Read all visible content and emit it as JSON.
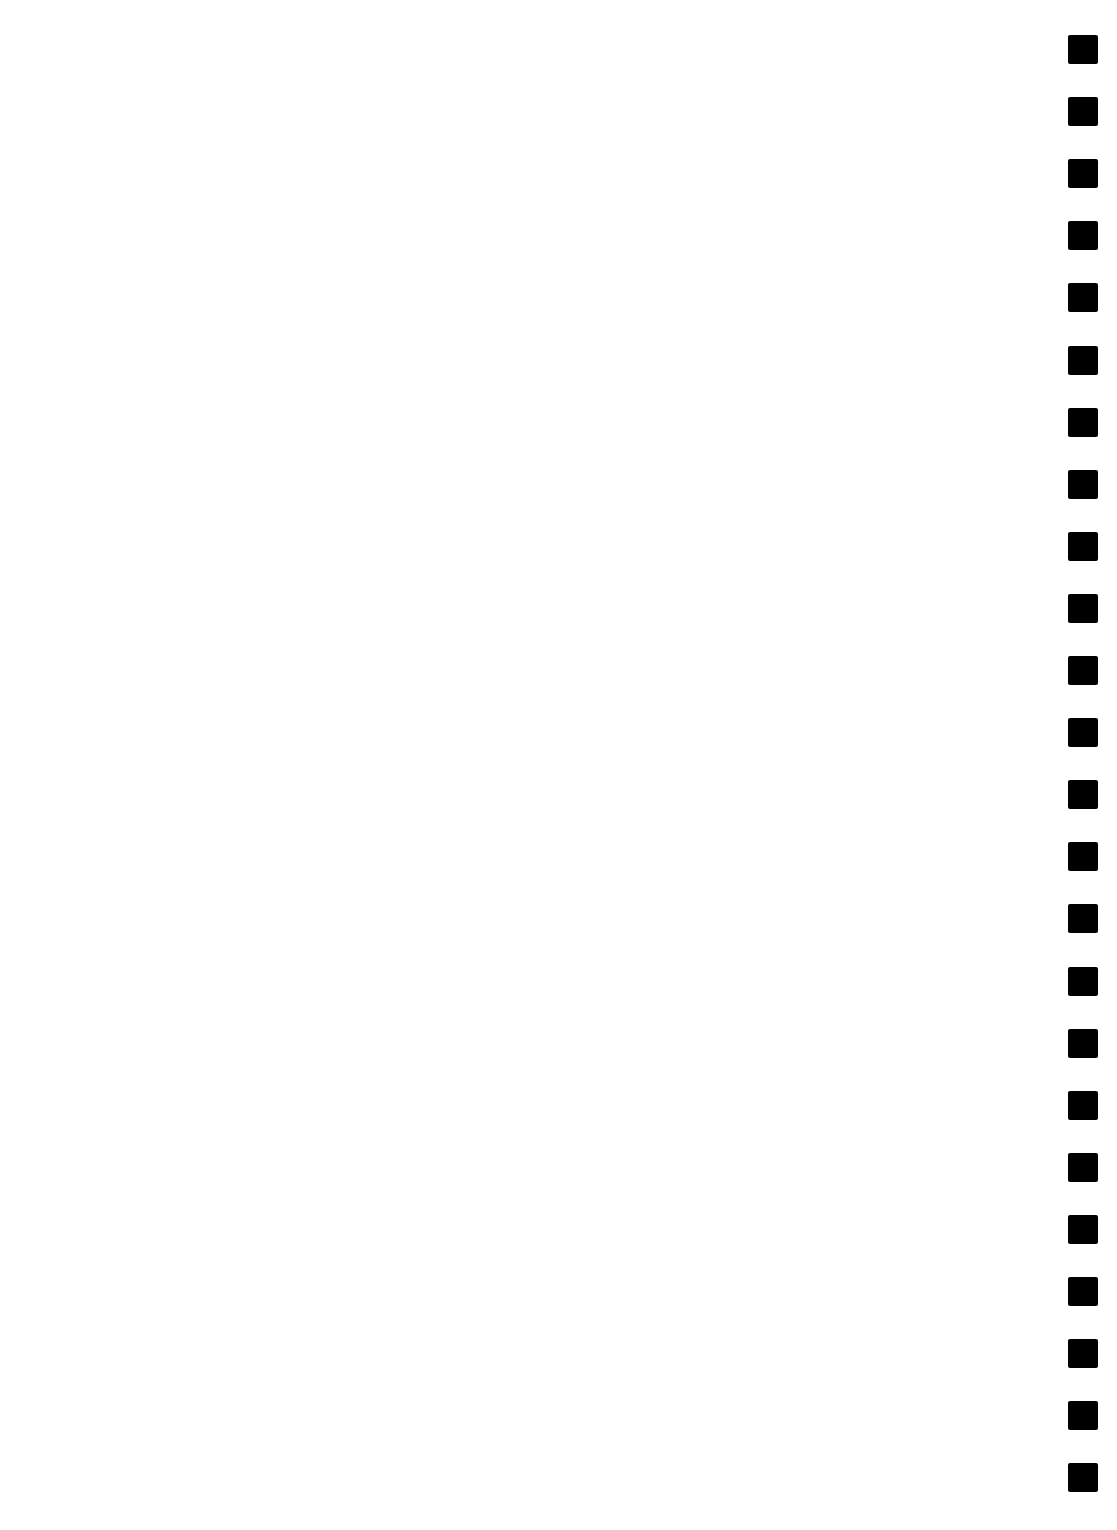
{
  "page": {
    "background": "#ffffff",
    "text": ""
  },
  "marks": {
    "color": "#000000",
    "count": 24,
    "first_top": 35,
    "pitch": 62.1
  }
}
